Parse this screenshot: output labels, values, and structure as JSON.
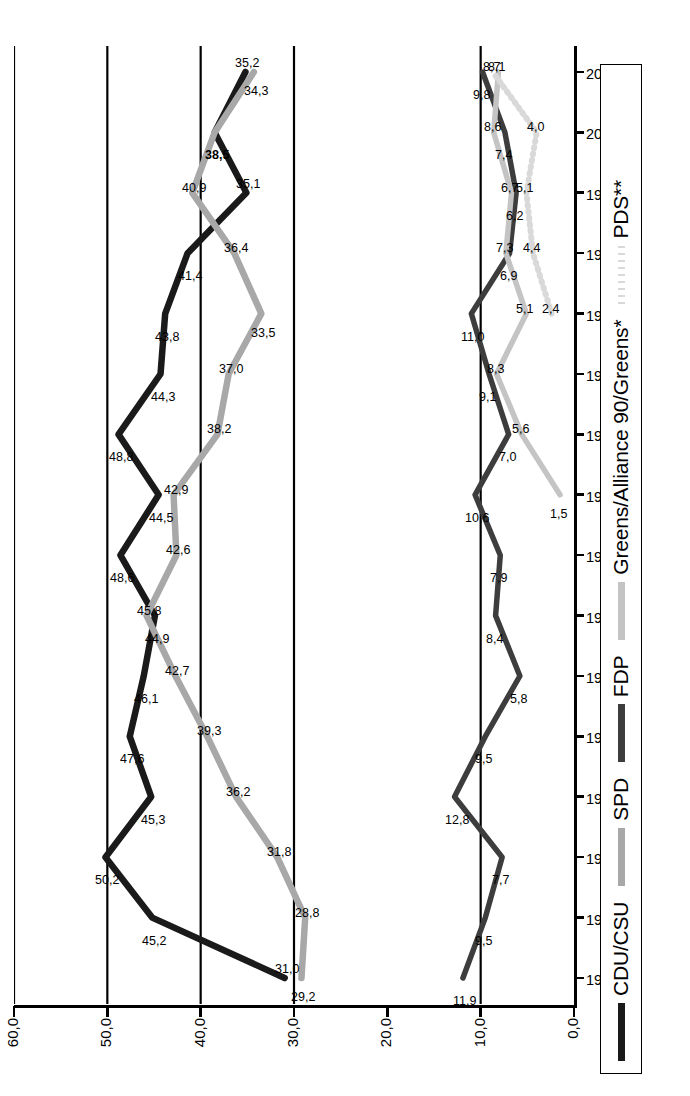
{
  "chart_data": {
    "type": "line",
    "title": "",
    "xlabel": "",
    "ylabel": "",
    "ylim": [
      0,
      60
    ],
    "yticks": [
      "0,0",
      "10,0",
      "20,0",
      "30,0",
      "40,0",
      "50,0",
      "60,0"
    ],
    "ytick_values": [
      0,
      10,
      20,
      30,
      40,
      50,
      60
    ],
    "grid": true,
    "legend_position": "bottom",
    "categories": [
      "1949",
      "1953",
      "1957",
      "1961",
      "1965",
      "1969",
      "1972",
      "1976",
      "1980",
      "1983",
      "1987",
      "1990",
      "1994",
      "1998",
      "2002",
      "2005"
    ],
    "series": [
      {
        "name": "CDU/CSU",
        "color": "#1a1a1a",
        "style": "solid",
        "values": [
          31.0,
          45.2,
          50.2,
          45.3,
          47.6,
          46.1,
          44.9,
          48.6,
          44.5,
          48.8,
          44.3,
          43.8,
          41.4,
          35.1,
          38.5,
          35.2
        ],
        "labels": [
          "31,0",
          "45,2",
          "50,2",
          "45,3",
          "47,6",
          "46,1",
          "44,9",
          "48,6",
          "44,5",
          "48,8",
          "44,3",
          "43,8",
          "41,4",
          "35,1",
          "38,5",
          "35,2"
        ],
        "bold_labels": [
          "38,5"
        ]
      },
      {
        "name": "SPD",
        "color": "#a8a8a8",
        "style": "solid",
        "values": [
          29.2,
          28.8,
          31.8,
          36.2,
          39.3,
          42.7,
          45.8,
          42.6,
          42.9,
          38.2,
          37.0,
          33.5,
          36.4,
          40.9,
          38.5,
          34.3
        ],
        "labels": [
          "29,2",
          "28,8",
          "31,8",
          "36,2",
          "39,3",
          "42,7",
          "45,8",
          "42,6",
          "42,9",
          "38,2",
          "37,0",
          "33,5",
          "36,4",
          "40,9",
          "",
          "34,3"
        ]
      },
      {
        "name": "FDP",
        "color": "#3d3d3d",
        "style": "solid",
        "values": [
          11.9,
          9.5,
          7.7,
          12.8,
          9.5,
          5.8,
          8.4,
          7.9,
          10.6,
          7.0,
          9.1,
          11.0,
          6.9,
          6.2,
          7.4,
          9.8
        ],
        "labels": [
          "11,9",
          "9,5",
          "7,7",
          "12,8",
          "9,5",
          "5,8",
          "8,4",
          "7,9",
          "10,6",
          "7,0",
          "9,1",
          "11,0",
          "6,9",
          "6,2",
          "7,4",
          "9,8"
        ]
      },
      {
        "name": "Greens/Alliance 90/Greens*",
        "color": "#c4c4c4",
        "style": "solid",
        "values": [
          null,
          null,
          null,
          null,
          null,
          null,
          null,
          null,
          1.5,
          5.6,
          8.3,
          5.1,
          7.3,
          6.7,
          8.6,
          8.1
        ],
        "labels": [
          "",
          "",
          "",
          "",
          "",
          "",
          "",
          "",
          "1,5",
          "5,6",
          "8,3",
          "5,1",
          "7,3",
          "6,7",
          "8,6",
          "8,1"
        ]
      },
      {
        "name": "PDS**",
        "color": "#d9d9d9",
        "style": "dotted",
        "values": [
          null,
          null,
          null,
          null,
          null,
          null,
          null,
          null,
          null,
          null,
          null,
          2.4,
          4.4,
          5.1,
          4.0,
          8.7
        ],
        "labels": [
          "",
          "",
          "",
          "",
          "",
          "",
          "",
          "",
          "",
          "",
          "",
          "2,4",
          "4,4",
          "5,1",
          "4,0",
          "8,7"
        ]
      }
    ]
  },
  "legend": {
    "items": [
      {
        "label": "CDU/CSU",
        "color": "#1a1a1a",
        "style": "solid"
      },
      {
        "label": "SPD",
        "color": "#a8a8a8",
        "style": "solid"
      },
      {
        "label": "FDP",
        "color": "#3d3d3d",
        "style": "solid"
      },
      {
        "label": "Greens/Alliance 90/Greens*",
        "color": "#c4c4c4",
        "style": "solid"
      },
      {
        "label": "PDS**",
        "color": "#d9d9d9",
        "style": "dotted"
      }
    ]
  },
  "colors": {
    "axis": "#000000",
    "grid": "#000000",
    "background": "#ffffff"
  }
}
